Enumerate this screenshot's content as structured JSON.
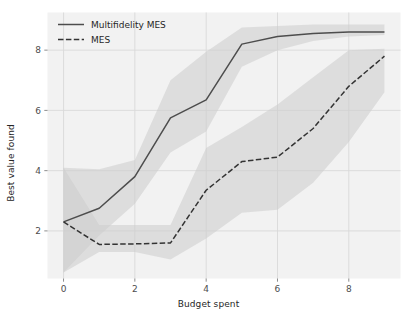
{
  "chart_data": {
    "type": "line",
    "title": "",
    "xlabel": "Budget spent",
    "ylabel": "Best value found",
    "xlim": [
      -0.45,
      9.45
    ],
    "ylim": [
      0.42,
      9.25
    ],
    "xticks": [
      0,
      2,
      4,
      6,
      8
    ],
    "xticklabels": [
      "0",
      "2",
      "4",
      "6",
      "8"
    ],
    "yticks": [
      2,
      4,
      6,
      8
    ],
    "yticklabels": [
      "2",
      "4",
      "6",
      "8"
    ],
    "grid": true,
    "grid_color": "#d9d9d9",
    "background": "#f2f2f2",
    "figure_background": "#ffffff",
    "legend_position": "upper left",
    "x": [
      0,
      1,
      2,
      3,
      4,
      5,
      6,
      7,
      8,
      9
    ],
    "series": [
      {
        "name": "Multifidelity MES",
        "linestyle": "solid",
        "color": "#4d4d4d",
        "values": [
          2.3,
          2.75,
          3.8,
          5.75,
          6.35,
          8.2,
          8.45,
          8.55,
          8.6,
          8.6
        ],
        "band_lower": [
          0.62,
          1.85,
          2.9,
          4.6,
          5.3,
          7.45,
          8.0,
          8.3,
          8.45,
          8.5
        ],
        "band_upper": [
          4.1,
          4.05,
          4.35,
          7.0,
          7.95,
          8.75,
          8.8,
          8.85,
          8.85,
          8.85
        ],
        "band_color": "#cccccc",
        "band_alpha": 0.55
      },
      {
        "name": "MES",
        "linestyle": "dashed",
        "color": "#333333",
        "values": [
          2.3,
          1.55,
          1.57,
          1.6,
          3.35,
          4.3,
          4.45,
          5.4,
          6.8,
          7.8
        ],
        "band_lower": [
          0.62,
          1.3,
          1.3,
          1.05,
          1.75,
          2.6,
          2.7,
          3.6,
          4.95,
          6.6
        ],
        "band_upper": [
          4.1,
          2.2,
          2.2,
          2.2,
          4.75,
          5.45,
          6.2,
          7.1,
          8.0,
          8.05
        ],
        "band_color": "#cccccc",
        "band_alpha": 0.55
      }
    ]
  },
  "legend": {
    "items": [
      {
        "label": "Multifidelity MES",
        "style": "solid"
      },
      {
        "label": "MES",
        "style": "dashed"
      }
    ]
  }
}
